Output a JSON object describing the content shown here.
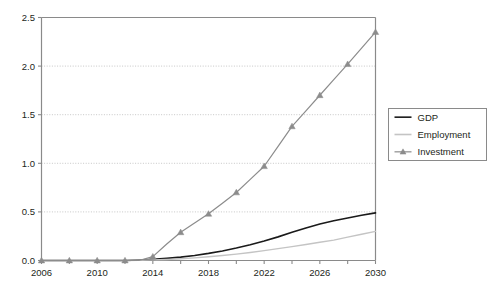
{
  "chart_data": {
    "type": "line",
    "title": "",
    "subtitle": "",
    "xlabel": "",
    "ylabel": "",
    "x": [
      2006,
      2007,
      2008,
      2009,
      2010,
      2011,
      2012,
      2013,
      2014,
      2015,
      2016,
      2017,
      2018,
      2019,
      2020,
      2021,
      2022,
      2023,
      2024,
      2025,
      2026,
      2027,
      2028,
      2029,
      2030
    ],
    "xlim": [
      2006,
      2030
    ],
    "ylim": [
      0.0,
      2.5
    ],
    "xticks": [
      2006,
      2008,
      2010,
      2012,
      2014,
      2016,
      2018,
      2020,
      2022,
      2024,
      2026,
      2028,
      2030
    ],
    "xtick_labels": [
      "2006",
      "",
      "2010",
      "",
      "2014",
      "",
      "2018",
      "",
      "2022",
      "",
      "2026",
      "",
      "2030"
    ],
    "xtick_labels_shown": [
      "2006",
      "2010",
      "2014",
      "2018",
      "2022",
      "2026",
      "2030"
    ],
    "yticks": [
      0.0,
      0.5,
      1.0,
      1.5,
      2.0,
      2.5
    ],
    "ytick_labels": [
      "0.0",
      "0.5",
      "1.0",
      "1.5",
      "2.0",
      "2.5"
    ],
    "grid": "horizontal-dotted",
    "legend_position": "right",
    "series": [
      {
        "name": "GDP",
        "color": "#1a1a1a",
        "marker": "none",
        "width": 1.6,
        "values": [
          0.0,
          0.0,
          0.0,
          0.0,
          0.0,
          0.0,
          0.0,
          0.005,
          0.012,
          0.022,
          0.035,
          0.052,
          0.073,
          0.098,
          0.128,
          0.162,
          0.2,
          0.243,
          0.29,
          0.335,
          0.375,
          0.408,
          0.437,
          0.465,
          0.49
        ]
      },
      {
        "name": "Employment",
        "color": "#c4c4c4",
        "marker": "none",
        "width": 1.4,
        "values": [
          0.0,
          0.0,
          0.0,
          0.0,
          0.0,
          0.0,
          0.0,
          0.002,
          0.006,
          0.011,
          0.018,
          0.027,
          0.038,
          0.051,
          0.066,
          0.083,
          0.102,
          0.122,
          0.143,
          0.165,
          0.188,
          0.21,
          0.24,
          0.27,
          0.3
        ]
      },
      {
        "name": "Investment",
        "color": "#8c8c8c",
        "marker": "triangle",
        "width": 1.2,
        "marker_x": [
          2006,
          2008,
          2010,
          2012,
          2014,
          2016,
          2018,
          2020,
          2022,
          2024,
          2026,
          2028,
          2030
        ],
        "marker_values": [
          0.0,
          0.0,
          0.0,
          0.0,
          0.04,
          0.29,
          0.48,
          0.7,
          0.97,
          1.38,
          1.7,
          2.02,
          2.35
        ],
        "values": [
          0.0,
          0.0,
          0.0,
          0.0,
          0.0,
          0.0,
          0.0,
          0.0,
          0.04,
          0.17,
          0.29,
          0.385,
          0.48,
          0.59,
          0.7,
          0.835,
          0.97,
          1.175,
          1.38,
          1.54,
          1.7,
          1.86,
          2.02,
          2.185,
          2.35
        ]
      }
    ],
    "legend": [
      {
        "label": "GDP",
        "color": "#1a1a1a",
        "marker": "none"
      },
      {
        "label": "Employment",
        "color": "#c4c4c4",
        "marker": "none"
      },
      {
        "label": "Investment",
        "color": "#8c8c8c",
        "marker": "triangle"
      }
    ]
  },
  "axis": {
    "axis_color": "#8a8a8a",
    "grid_color": "#b9b9b9",
    "text_color": "#231f20"
  }
}
